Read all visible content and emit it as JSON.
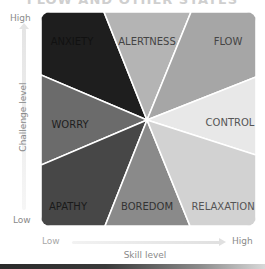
{
  "title": "FLOW AND OTHER STATES",
  "axes": {
    "y": {
      "title": "Challenge level",
      "high": "High",
      "low": "Low"
    },
    "x": {
      "title": "Skill level",
      "low": "Low",
      "high": "High"
    }
  },
  "grid": {
    "left": 41,
    "top": 12,
    "right": 256,
    "bottom": 226,
    "radius": 9,
    "center": [
      147,
      120
    ],
    "divider_color": "#ffffff"
  },
  "regions": [
    {
      "id": "anxiety",
      "label": "ANXIETY",
      "color": "#1e1e1e",
      "text_color": "#111111",
      "points": "41,12 104,12 147,120 41,75",
      "label_pos": [
        72,
        42
      ]
    },
    {
      "id": "alertness",
      "label": "ALERTNESS",
      "color": "#b4b4b4",
      "text_color": "#444444",
      "points": "104,12 191,12 147,120",
      "label_pos": [
        147,
        42
      ]
    },
    {
      "id": "flow",
      "label": "FLOW",
      "color": "#a6a6a6",
      "text_color": "#444444",
      "points": "191,12 256,12 256,77 147,120",
      "label_pos": [
        228,
        42
      ]
    },
    {
      "id": "worry",
      "label": "WORRY",
      "color": "#6b6b6b",
      "text_color": "#1e1e1e",
      "points": "41,75 147,120 41,165",
      "label_pos": [
        70,
        125
      ]
    },
    {
      "id": "control",
      "label": "CONTROL",
      "color": "#e8e8e8",
      "text_color": "#555555",
      "points": "256,77 256,155 147,120",
      "label_pos": [
        230,
        123
      ]
    },
    {
      "id": "apathy",
      "label": "APATHY",
      "color": "#474747",
      "text_color": "#1a1a1a",
      "points": "41,165 147,120 105,226 41,226",
      "label_pos": [
        68,
        207
      ]
    },
    {
      "id": "boredom",
      "label": "BOREDOM",
      "color": "#8a8a8a",
      "text_color": "#333333",
      "points": "105,226 147,120 190,226",
      "label_pos": [
        147,
        207
      ]
    },
    {
      "id": "relaxation",
      "label": "RELAXATION",
      "color": "#d2d2d2",
      "text_color": "#555555",
      "points": "190,226 147,120 256,155 256,226",
      "label_pos": [
        223,
        207
      ]
    }
  ]
}
